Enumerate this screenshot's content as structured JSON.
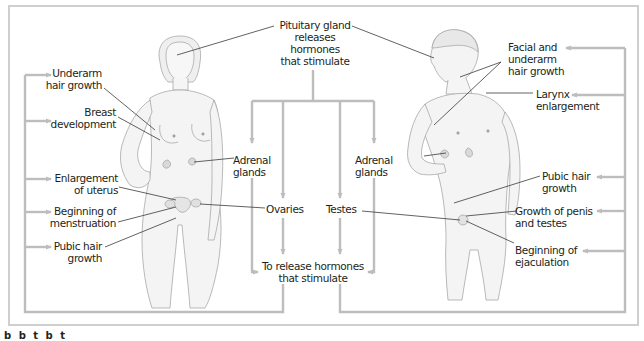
{
  "diagram": {
    "colors": {
      "frame": "#c8c8c8",
      "connector": "#bdbdbd",
      "leader": "#3a3a3a",
      "text": "#231f20",
      "skin": "#f3f3f3",
      "outline": "#9a9a9a"
    },
    "center": {
      "pituitary": "Pituitary gland\nreleases\nhormones\nthat stimulate",
      "adrenal_left": "Adrenal\nglands",
      "adrenal_right": "Adrenal\nglands",
      "ovaries": "Ovaries",
      "testes": "Testes",
      "release": "To release hormones\nthat stimulate"
    },
    "female": {
      "figure": "female-figure",
      "effects": [
        {
          "label": "Underarm\nhair growth"
        },
        {
          "label": "Breast\ndevelopment"
        },
        {
          "label": "Enlargement\nof uterus"
        },
        {
          "label": "Beginning of\nmenstruation"
        },
        {
          "label": "Pubic hair\ngrowth"
        }
      ]
    },
    "male": {
      "figure": "male-figure",
      "effects": [
        {
          "label": "Facial and\nunderarm\nhair growth"
        },
        {
          "label": "Larynx\nenlargement"
        },
        {
          "label": "Pubic hair\ngrowth"
        },
        {
          "label": "Growth of penis\nand testes"
        },
        {
          "label": "Beginning of\nejaculation"
        }
      ]
    },
    "caption_partial": "b b         t  b t"
  }
}
